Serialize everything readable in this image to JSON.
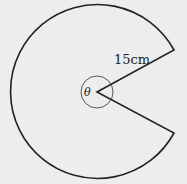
{
  "diagram": {
    "shape": "circular sector (pac-man shape)",
    "radius_label": "15cm",
    "angle_label": "θ",
    "radius_value": 15,
    "radius_unit": "cm",
    "stroke_color": "#222222",
    "background_color": "#ededed"
  }
}
